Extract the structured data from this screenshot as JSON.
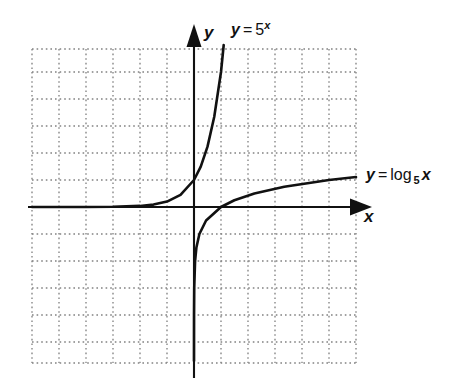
{
  "figure": {
    "background_color": "#ffffff",
    "ink_color": "#111111",
    "grid_color": "#7d7d7d"
  },
  "axes": {
    "x_label": "x",
    "y_label": "y",
    "origin_px": {
      "x": 194,
      "y": 207
    },
    "grid_spacing_px": 27,
    "x_range": [
      -6,
      6
    ],
    "y_range": [
      -5.8,
      5.8
    ],
    "grid": "dotted",
    "arrows": [
      "x-positive",
      "y-positive"
    ]
  },
  "labels": {
    "exponential": {
      "lhs": "y",
      "eq": "=",
      "base": "5",
      "exponent": "x",
      "text": "y = 5^x"
    },
    "logarithm": {
      "lhs": "y",
      "eq": "=",
      "fn": "log",
      "base": "5",
      "arg": "x",
      "text": "y = log 5 x"
    }
  },
  "chart_data": {
    "type": "line",
    "title": "",
    "xlabel": "x",
    "ylabel": "y",
    "xlim": [
      -6,
      6
    ],
    "ylim": [
      -5.8,
      5.8
    ],
    "grid": true,
    "legend": "inline-annotations",
    "series": [
      {
        "name": "y = 5^x",
        "expression": "y = 5^x",
        "color": "#111111",
        "annotation_position": "top-right-of-curve",
        "points": [
          {
            "x": -6.0,
            "y": 0.0001
          },
          {
            "x": -5.0,
            "y": 0.0003
          },
          {
            "x": -4.0,
            "y": 0.0016
          },
          {
            "x": -3.0,
            "y": 0.008
          },
          {
            "x": -2.0,
            "y": 0.04
          },
          {
            "x": -1.5,
            "y": 0.089
          },
          {
            "x": -1.0,
            "y": 0.2
          },
          {
            "x": -0.5,
            "y": 0.447
          },
          {
            "x": 0.0,
            "y": 1.0
          },
          {
            "x": 0.25,
            "y": 1.495
          },
          {
            "x": 0.5,
            "y": 2.236
          },
          {
            "x": 0.75,
            "y": 3.344
          },
          {
            "x": 1.0,
            "y": 5.0
          },
          {
            "x": 1.1,
            "y": 6.0
          }
        ]
      },
      {
        "name": "y = log_5 x",
        "expression": "y = log base 5 of x",
        "color": "#111111",
        "annotation_position": "right-end-of-curve",
        "points": [
          {
            "x": 0.0001,
            "y": -5.7
          },
          {
            "x": 0.0003,
            "y": -5.0
          },
          {
            "x": 0.0016,
            "y": -4.0
          },
          {
            "x": 0.008,
            "y": -3.0
          },
          {
            "x": 0.04,
            "y": -2.0
          },
          {
            "x": 0.089,
            "y": -1.5
          },
          {
            "x": 0.2,
            "y": -1.0
          },
          {
            "x": 0.447,
            "y": -0.5
          },
          {
            "x": 1.0,
            "y": 0.0
          },
          {
            "x": 1.495,
            "y": 0.25
          },
          {
            "x": 2.236,
            "y": 0.5
          },
          {
            "x": 3.344,
            "y": 0.75
          },
          {
            "x": 5.0,
            "y": 1.0
          },
          {
            "x": 6.0,
            "y": 1.11
          }
        ]
      }
    ],
    "notes": [
      "The two curves are reflections of each other across the line y = x.",
      "y = 5^x has a horizontal asymptote at y = 0 and passes through (0, 1).",
      "y = log base 5 of x has a vertical asymptote at x = 0 and passes through (1, 0)."
    ]
  }
}
